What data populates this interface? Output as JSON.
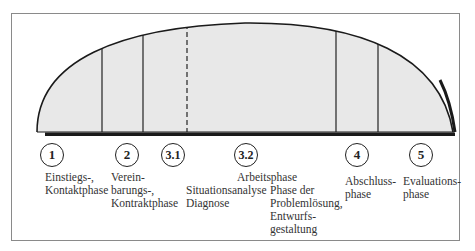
{
  "diagram": {
    "type": "phase-arc",
    "colors": {
      "fill": "#e8e8e8",
      "stroke": "#1a1a1a",
      "frame": "#8a8a8a"
    },
    "phases": [
      {
        "number": "1",
        "label": "Einstiegs-,\nKontaktphase"
      },
      {
        "number": "2",
        "label": "Verein-\nbarungs-,\nKontraktphase"
      },
      {
        "number": "3.1",
        "label": "Situationsanalyse\nDiagnose"
      },
      {
        "number": "3.2",
        "label": "Phase der\nProblemlösung,\nEntwurfs-\ngestaltung"
      },
      {
        "number": "4",
        "label": "Abschluss-\nphase"
      },
      {
        "number": "5",
        "label": "Evaluations-\nphase"
      }
    ],
    "group_label": "Arbeitsphase"
  }
}
